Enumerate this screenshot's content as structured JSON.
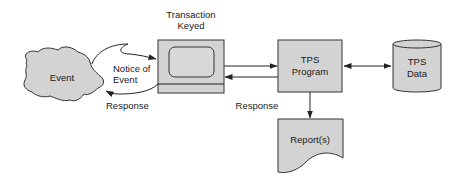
{
  "diagram": {
    "colors": {
      "shape_fill": "#d3d3d3",
      "stroke": "#333333",
      "background": "#ffffff",
      "text": "#1a1a1a"
    },
    "nodes": {
      "event": {
        "label": "Event",
        "shape": "cloud"
      },
      "terminal": {
        "label_line1": "Transaction",
        "label_line2": "Keyed",
        "shape": "terminal"
      },
      "program": {
        "label_line1": "TPS",
        "label_line2": "Program",
        "shape": "rectangle"
      },
      "data": {
        "label_line1": "TPS",
        "label_line2": "Data",
        "shape": "cylinder"
      },
      "report": {
        "label": "Report(s)",
        "shape": "document"
      }
    },
    "edges": {
      "notice": {
        "label_line1": "Notice of",
        "label_line2": "Event",
        "from": "event",
        "to": "terminal"
      },
      "response_left": {
        "label": "Response",
        "from": "terminal",
        "to": "event"
      },
      "to_program": {
        "from": "terminal",
        "to": "program"
      },
      "response_mid": {
        "label": "Response",
        "from": "program",
        "to": "terminal"
      },
      "program_data": {
        "from": "program",
        "to": "data",
        "bidirectional": true
      },
      "program_report": {
        "from": "program",
        "to": "report"
      }
    }
  }
}
